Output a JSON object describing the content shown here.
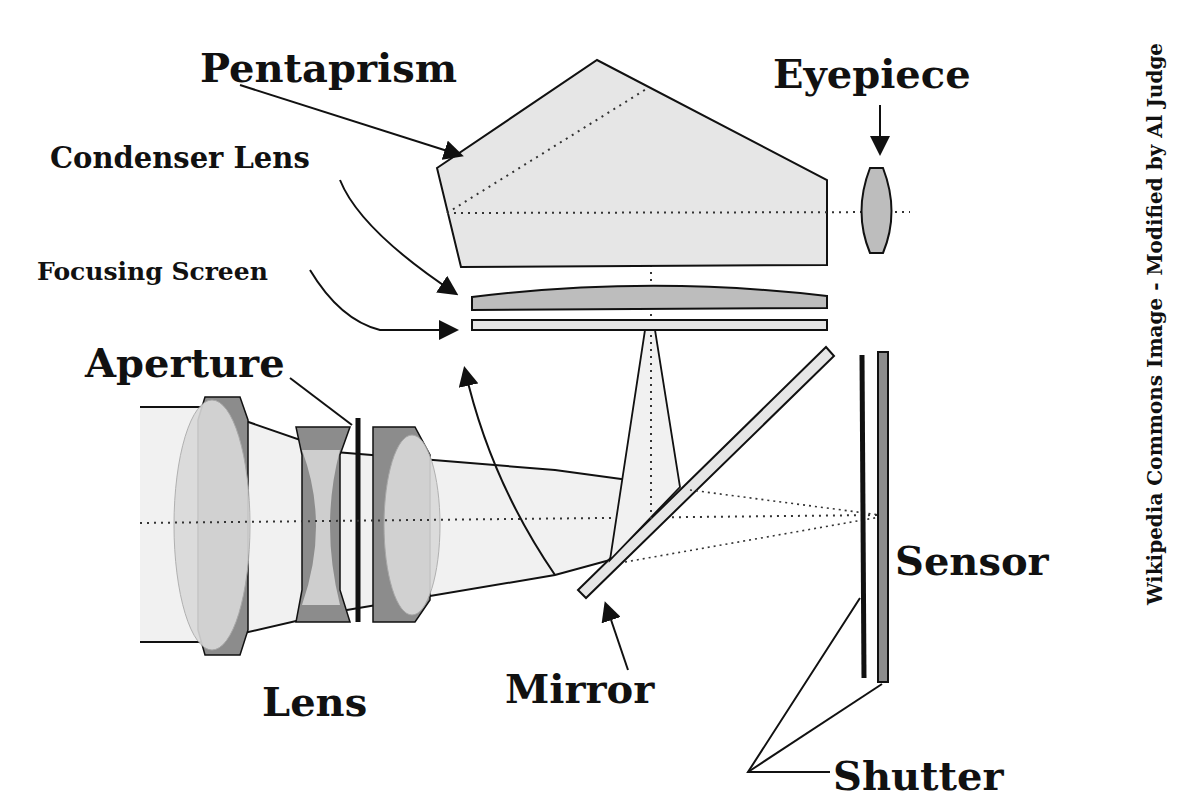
{
  "diagram": {
    "type": "SLR camera cross-section",
    "labels": {
      "pentaprism": "Pentaprism",
      "eyepiece": "Eyepiece",
      "condenser_lens": "Condenser Lens",
      "focusing_screen": "Focusing Screen",
      "aperture": "Aperture",
      "lens": "Lens",
      "mirror": "Mirror",
      "sensor": "Sensor",
      "shutter": "Shutter"
    },
    "credit": "Wikipedia Commons Image - Modified by Al Judge",
    "colors": {
      "light_fill": "#e6e6e6",
      "mid_fill": "#bdbdbd",
      "dark_fill": "#8c8c8c",
      "stroke": "#111111",
      "beam": "#f1f1f1"
    }
  }
}
